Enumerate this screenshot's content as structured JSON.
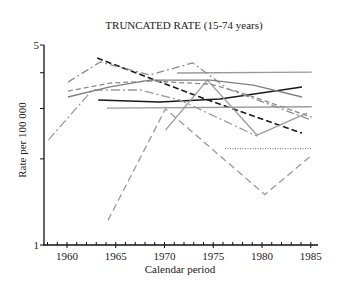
{
  "chart_data": {
    "type": "line",
    "title": "TRUNCATED RATE (15-74 years)",
    "xlabel": "Calendar period",
    "ylabel": "Rate per 100 000",
    "xlim": [
      1957.6,
      1985.8
    ],
    "ylim": [
      1,
      5
    ],
    "yscale": "log",
    "grid": false,
    "legend": null,
    "x_ticks": [
      "1960",
      "1965",
      "1970",
      "1975",
      "1980",
      "1985"
    ],
    "y_tick_labels": [
      "5",
      "1"
    ],
    "y_ticks": [
      1,
      2,
      3,
      4,
      5
    ],
    "series": [
      {
        "style": "black dashed",
        "color": "#1a1a1a",
        "dash": "6,3",
        "width": 1.6,
        "x": [
          1963.1,
          1973.5,
          1984.1
        ],
        "y": [
          4.5,
          3.3,
          2.46
        ]
      },
      {
        "style": "black solid",
        "color": "#1a1a1a",
        "dash": "",
        "width": 1.5,
        "x": [
          1963.2,
          1969.5,
          1975.7,
          1984.1
        ],
        "y": [
          3.21,
          3.16,
          3.24,
          3.57
        ]
      },
      {
        "style": "gray solid",
        "color": "#9a9a9a",
        "dash": "",
        "width": 1.4,
        "x": [
          1971.3,
          1985.1
        ],
        "y": [
          3.99,
          4.02
        ]
      },
      {
        "style": "gray solid",
        "color": "#9a9a9a",
        "dash": "",
        "width": 1.4,
        "x": [
          1964.1,
          1985.1
        ],
        "y": [
          3.01,
          3.04
        ]
      },
      {
        "style": "gray dotted",
        "color": "#8a8a8a",
        "dash": "1,1.5",
        "width": 1.2,
        "x": [
          1976.2,
          1985.1
        ],
        "y": [
          2.17,
          2.17
        ]
      },
      {
        "style": "gray long dashed",
        "color": "#9a9a9a",
        "dash": "7,4",
        "width": 1.3,
        "x": [
          1964.2,
          1970.1,
          1980.3,
          1985.1
        ],
        "y": [
          1.22,
          2.99,
          1.5,
          2.06
        ]
      },
      {
        "style": "gray dash-dot",
        "color": "#8f8f8f",
        "dash": "8,3,2,3",
        "width": 1.3,
        "x": [
          1960.1,
          1963.4,
          1968.5,
          1972.9,
          1976.5,
          1985.1
        ],
        "y": [
          3.71,
          4.36,
          3.93,
          4.33,
          3.51,
          2.73
        ]
      },
      {
        "style": "gray dash-dot",
        "color": "#9a9a9a",
        "dash": "9,3,2,3",
        "width": 1.3,
        "x": [
          1958.1,
          1962.6,
          1967.5,
          1971.6,
          1979.5
        ],
        "y": [
          2.33,
          3.48,
          3.48,
          3.21,
          2.4
        ]
      },
      {
        "style": "gray solid",
        "color": "#9a9a9a",
        "dash": "",
        "width": 1.3,
        "x": [
          1970.1,
          1974.4,
          1979.5,
          1984.6
        ],
        "y": [
          2.52,
          3.77,
          2.42,
          2.89
        ]
      },
      {
        "style": "gray dashed",
        "color": "#8a8a8a",
        "dash": "5,3",
        "width": 1.3,
        "x": [
          1960.1,
          1964.4,
          1968.5,
          1974.7,
          1977.7,
          1985.1
        ],
        "y": [
          3.45,
          3.68,
          3.74,
          3.65,
          3.42,
          2.8
        ]
      },
      {
        "style": "gray solid",
        "color": "#7f7f7f",
        "dash": "",
        "width": 1.3,
        "x": [
          1960.1,
          1964.4,
          1968.5,
          1974.7,
          1979.1,
          1984.1
        ],
        "y": [
          3.29,
          3.57,
          3.77,
          3.77,
          3.62,
          3.29
        ]
      }
    ]
  }
}
